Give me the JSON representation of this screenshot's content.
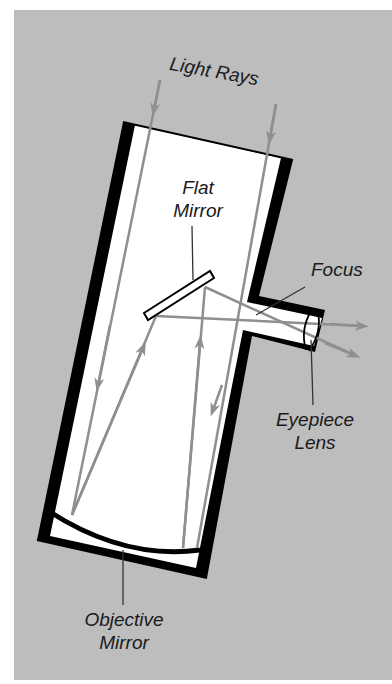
{
  "diagram": {
    "colors": {
      "background": "#bdbdbd",
      "tube_fill": "#ffffff",
      "tube_wall": "#000000",
      "ray": "#8f8f8f",
      "leader": "#333333"
    },
    "labels": {
      "light_rays": "Light Rays",
      "flat_mirror_line1": "Flat",
      "flat_mirror_line2": "Mirror",
      "focus": "Focus",
      "eyepiece_line1": "Eyepiece",
      "eyepiece_line2": "Lens",
      "objective_line1": "Objective",
      "objective_line2": "Mirror"
    },
    "components": [
      {
        "name": "telescope-tube"
      },
      {
        "name": "flat-mirror"
      },
      {
        "name": "objective-mirror"
      },
      {
        "name": "eyepiece-tube"
      },
      {
        "name": "eyepiece-lens"
      },
      {
        "name": "light-rays",
        "count": 2
      }
    ]
  }
}
